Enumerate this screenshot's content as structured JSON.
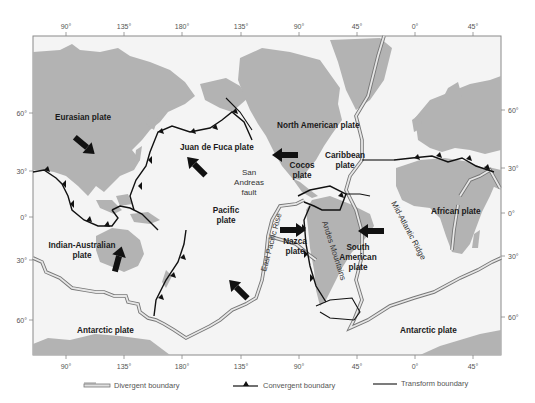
{
  "map": {
    "title": "Tectonic plates of the world",
    "colors": {
      "land": "#b3b3b3",
      "ocean": "#f4f4f4",
      "frame": "#888888",
      "boundary": "#1a1a1a",
      "divergent_fill": "#d9d9d9",
      "arrow": "#111111"
    },
    "longitude_ticks_top": [
      "90°",
      "135°",
      "180°",
      "135°",
      "90°",
      "45°",
      "0°",
      "45°"
    ],
    "longitude_ticks_bottom": [
      "90°",
      "135°",
      "180°",
      "135°",
      "90°",
      "45°",
      "0°",
      "45°"
    ],
    "latitude_ticks_left": [
      "60°",
      "30°",
      "0°",
      "30°",
      "60°"
    ],
    "latitude_ticks_right": [
      "60°",
      "30°",
      "0°",
      "30°",
      "60°"
    ],
    "plates": [
      {
        "name": "Eurasian plate"
      },
      {
        "name": "Juan de Fuca plate"
      },
      {
        "name": "North American plate"
      },
      {
        "name": "Cocos plate",
        "lines": [
          "Cocos",
          "plate"
        ]
      },
      {
        "name": "Caribbean plate",
        "lines": [
          "Caribbean",
          "plate"
        ]
      },
      {
        "name": "Pacific plate",
        "lines": [
          "Pacific",
          "plate"
        ]
      },
      {
        "name": "Indian-Australian plate",
        "lines": [
          "Indian-Australian",
          "plate"
        ]
      },
      {
        "name": "Nazca plate",
        "lines": [
          "Nazca",
          "plate"
        ]
      },
      {
        "name": "South American plate",
        "lines": [
          "South",
          "American",
          "plate"
        ]
      },
      {
        "name": "African plate"
      },
      {
        "name": "Antarctic plate (west)",
        "label": "Antarctic plate"
      },
      {
        "name": "Antarctic plate (east)",
        "label": "Antarctic plate"
      }
    ],
    "features": {
      "san_andreas": [
        "San",
        "Andreas",
        "fault"
      ],
      "east_pacific_rise": "East Pacific Rise",
      "andes": "Andes Mountains",
      "mid_atlantic": "Mid-Atlantic Ridge"
    }
  },
  "legend": {
    "divergent": "Divergent boundary",
    "convergent": "Convergent  boundary",
    "transform": "Transform boundary"
  }
}
